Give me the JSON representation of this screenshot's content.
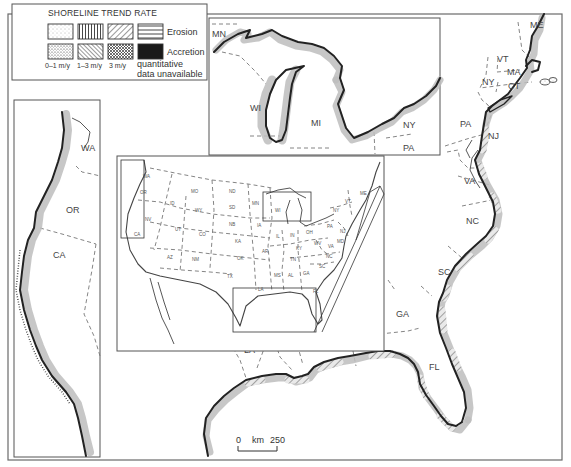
{
  "legend": {
    "title": "SHORELINE TREND RATE",
    "rows": [
      {
        "label": "Erosion",
        "swatches": [
          "dots-light",
          "vertical-lines",
          "diagonal-lines",
          "horizontal-lines"
        ]
      },
      {
        "label": "Accretion",
        "swatches": [
          "dots-dense",
          "back-diagonal-lines",
          "crosshatch",
          "solid-black"
        ]
      }
    ],
    "rate_labels": [
      "0–1 m/y",
      "1–3 m/y",
      "3 m/y"
    ],
    "unavailable_label_1": "quantitative",
    "unavailable_label_2": "data unavailable"
  },
  "scale_bar": {
    "start": "0",
    "unit": "km",
    "end": "250"
  },
  "main_map": {
    "state_labels": [
      {
        "id": "ME",
        "text": "ME",
        "x": 530,
        "y": 28
      },
      {
        "id": "VT",
        "text": "VT",
        "x": 497,
        "y": 62
      },
      {
        "id": "MA",
        "text": "MA",
        "x": 507,
        "y": 75
      },
      {
        "id": "NY",
        "text": "NY",
        "x": 482,
        "y": 85
      },
      {
        "id": "CT",
        "text": "CT",
        "x": 508,
        "y": 89
      },
      {
        "id": "PA",
        "text": "PA",
        "x": 460,
        "y": 127
      },
      {
        "id": "NJ",
        "text": "NJ",
        "x": 490,
        "y": 137
      },
      {
        "id": "VA",
        "text": "VA",
        "x": 465,
        "y": 183
      },
      {
        "id": "NC",
        "text": "NC",
        "x": 468,
        "y": 223
      },
      {
        "id": "SC",
        "text": "SC",
        "x": 440,
        "y": 274
      },
      {
        "id": "GA",
        "text": "GA",
        "x": 398,
        "y": 316
      },
      {
        "id": "FL",
        "text": "FL",
        "x": 431,
        "y": 369
      },
      {
        "id": "AL",
        "text": "AL",
        "x": 359,
        "y": 331
      },
      {
        "id": "MS",
        "text": "MS",
        "x": 318,
        "y": 336
      },
      {
        "id": "LA",
        "text": "LA",
        "x": 247,
        "y": 352
      }
    ]
  },
  "west_inset": {
    "state_labels": [
      {
        "id": "WA",
        "text": "WA",
        "x": 82,
        "y": 151
      },
      {
        "id": "OR",
        "text": "OR",
        "x": 68,
        "y": 212
      },
      {
        "id": "CA",
        "text": "CA",
        "x": 55,
        "y": 258
      }
    ]
  },
  "great_lakes_inset": {
    "state_labels": [
      {
        "id": "MN",
        "text": "MN",
        "x": 213,
        "y": 36
      },
      {
        "id": "WI",
        "text": "WI",
        "x": 251,
        "y": 110
      },
      {
        "id": "MI",
        "text": "MI",
        "x": 311,
        "y": 125
      },
      {
        "id": "NY",
        "text": "NY",
        "x": 402,
        "y": 127
      },
      {
        "id": "PA",
        "text": "PA",
        "x": 402,
        "y": 150
      }
    ]
  },
  "overview_inset": {
    "state_labels": [
      {
        "text": "WA",
        "x": 143,
        "y": 178
      },
      {
        "text": "OR",
        "x": 140,
        "y": 194
      },
      {
        "text": "NV",
        "x": 145,
        "y": 221
      },
      {
        "text": "CA",
        "x": 136,
        "y": 236
      },
      {
        "text": "MO",
        "x": 191,
        "y": 193
      },
      {
        "text": "ID",
        "x": 170,
        "y": 205
      },
      {
        "text": "WY",
        "x": 195,
        "y": 212
      },
      {
        "text": "UT",
        "x": 175,
        "y": 231
      },
      {
        "text": "CO",
        "x": 199,
        "y": 236
      },
      {
        "text": "AZ",
        "x": 167,
        "y": 259
      },
      {
        "text": "NM",
        "x": 192,
        "y": 261
      },
      {
        "text": "ND",
        "x": 229,
        "y": 193
      },
      {
        "text": "SD",
        "x": 229,
        "y": 209
      },
      {
        "text": "NB",
        "x": 229,
        "y": 226
      },
      {
        "text": "KA",
        "x": 235,
        "y": 243
      },
      {
        "text": "OK",
        "x": 237,
        "y": 260
      },
      {
        "text": "TX",
        "x": 227,
        "y": 278
      },
      {
        "text": "MN",
        "x": 252,
        "y": 205
      },
      {
        "text": "IA",
        "x": 257,
        "y": 227
      },
      {
        "text": "AR",
        "x": 262,
        "y": 253
      },
      {
        "text": "LA",
        "x": 258,
        "y": 289
      },
      {
        "text": "MS",
        "x": 274,
        "y": 277
      },
      {
        "text": "AL",
        "x": 288,
        "y": 277
      },
      {
        "text": "WI",
        "x": 275,
        "y": 212
      },
      {
        "text": "IL",
        "x": 276,
        "y": 238
      },
      {
        "text": "IN",
        "x": 290,
        "y": 237
      },
      {
        "text": "OH",
        "x": 306,
        "y": 234
      },
      {
        "text": "KY",
        "x": 296,
        "y": 250
      },
      {
        "text": "TN",
        "x": 290,
        "y": 261
      },
      {
        "text": "GA",
        "x": 303,
        "y": 275
      },
      {
        "text": "FL",
        "x": 313,
        "y": 293
      },
      {
        "text": "WV",
        "x": 314,
        "y": 245
      },
      {
        "text": "VA",
        "x": 328,
        "y": 248
      },
      {
        "text": "MD",
        "x": 337,
        "y": 243
      },
      {
        "text": "NC",
        "x": 326,
        "y": 258
      },
      {
        "text": "SC",
        "x": 319,
        "y": 268
      },
      {
        "text": "NY",
        "x": 333,
        "y": 212
      },
      {
        "text": "PA",
        "x": 327,
        "y": 228
      },
      {
        "text": "ME",
        "x": 360,
        "y": 195
      },
      {
        "text": "VT",
        "x": 345,
        "y": 203
      },
      {
        "text": "NJ",
        "x": 340,
        "y": 233
      }
    ]
  },
  "colors": {
    "line": "#222222",
    "band": "#bdbdbd",
    "border_dash": "#777777",
    "frame": "#6a6a6a",
    "background": "#ffffff"
  }
}
